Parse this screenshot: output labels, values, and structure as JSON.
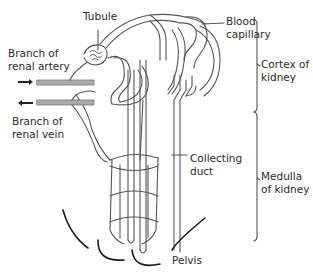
{
  "diagram": {
    "labels": {
      "tubule": "Tubule",
      "blood_capillary_1": "Blood",
      "blood_capillary_2": "capillary",
      "artery_1": "Branch of",
      "artery_2": "renal artery",
      "vein_1": "Branch of",
      "vein_2": "renal vein",
      "cortex_1": "Cortex of",
      "cortex_2": "kidney",
      "collecting_1": "Collecting",
      "collecting_2": "duct",
      "medulla_1": "Medulla",
      "medulla_2": "of kidney",
      "pelvis": "Pelvis"
    },
    "arrows": {
      "artery": "arrow-right (blood in)",
      "vein": "arrow-left (blood out)"
    },
    "colors": {
      "line": "#555555",
      "vessel_fill": "#aaaaaa",
      "pelvis_line": "#1a1a1a",
      "text": "#2b2b2b"
    }
  }
}
